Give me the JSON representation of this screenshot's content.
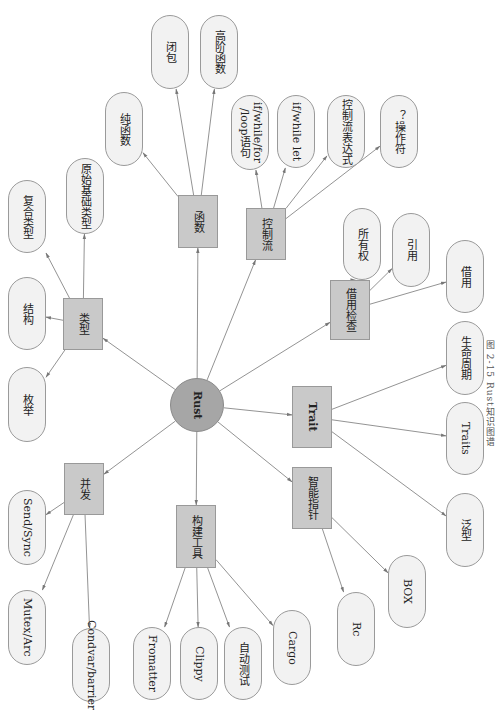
{
  "caption": "图 2-15  Rust知识图谱",
  "colors": {
    "root_fill": "#a6a6a6",
    "branch_fill": "#c9c9c9",
    "leaf_fill": "#f2f2f2",
    "edge": "#777777"
  },
  "root": {
    "id": "rust",
    "label": "Rust",
    "cx": 197,
    "cy": 405,
    "r": 27
  },
  "branches": [
    {
      "id": "types",
      "label": "类型",
      "x": 63,
      "y": 298,
      "w": 40,
      "h": 52
    },
    {
      "id": "functions",
      "label": "函数",
      "x": 178,
      "y": 195,
      "w": 40,
      "h": 53
    },
    {
      "id": "control-flow",
      "label": "控制流",
      "x": 246,
      "y": 208,
      "w": 40,
      "h": 52
    },
    {
      "id": "borrow-check",
      "label": "借用检查",
      "x": 330,
      "y": 280,
      "w": 40,
      "h": 60
    },
    {
      "id": "trait",
      "label": "Trait",
      "x": 292,
      "y": 386,
      "w": 40,
      "h": 62,
      "bold": true
    },
    {
      "id": "smart-pointers",
      "label": "智能指针",
      "x": 292,
      "y": 467,
      "w": 40,
      "h": 62
    },
    {
      "id": "build-tools",
      "label": "构建工具",
      "x": 176,
      "y": 505,
      "w": 40,
      "h": 63
    },
    {
      "id": "concurrency",
      "label": "并发",
      "x": 64,
      "y": 463,
      "w": 40,
      "h": 52
    }
  ],
  "leaves": [
    {
      "id": "compound-types",
      "parent": "types",
      "label": "复合类型",
      "x": 8,
      "y": 180,
      "w": 38,
      "h": 73
    },
    {
      "id": "primitive-types",
      "parent": "types",
      "label": "原始基础类型",
      "x": 66,
      "y": 158,
      "w": 38,
      "h": 76
    },
    {
      "id": "struct",
      "parent": "types",
      "label": "结构",
      "x": 8,
      "y": 277,
      "w": 38,
      "h": 73
    },
    {
      "id": "enum",
      "parent": "types",
      "label": "枚举",
      "x": 8,
      "y": 367,
      "w": 38,
      "h": 75
    },
    {
      "id": "pure-functions",
      "parent": "functions",
      "label": "纯函数",
      "x": 105,
      "y": 92,
      "w": 38,
      "h": 74
    },
    {
      "id": "closures",
      "parent": "functions",
      "label": "闭包",
      "x": 151,
      "y": 15,
      "w": 38,
      "h": 74
    },
    {
      "id": "higher-order-functions",
      "parent": "functions",
      "label": "高阶函数",
      "x": 200,
      "y": 15,
      "w": 38,
      "h": 74
    },
    {
      "id": "loop-statements",
      "parent": "control-flow",
      "label": "if/while/for\n/loop语句",
      "x": 231,
      "y": 95,
      "w": 38,
      "h": 75
    },
    {
      "id": "if-while-let",
      "parent": "control-flow",
      "label": "if/while let",
      "x": 277,
      "y": 95,
      "w": 38,
      "h": 73
    },
    {
      "id": "control-flow-expr",
      "parent": "control-flow",
      "label": "控制流表达式",
      "x": 327,
      "y": 95,
      "w": 38,
      "h": 73
    },
    {
      "id": "question-operator",
      "parent": "control-flow",
      "label": "？操作符",
      "x": 380,
      "y": 95,
      "w": 38,
      "h": 73
    },
    {
      "id": "ownership",
      "parent": "borrow-check",
      "label": "所有权",
      "x": 343,
      "y": 208,
      "w": 38,
      "h": 72
    },
    {
      "id": "references",
      "parent": "borrow-check",
      "label": "引用",
      "x": 392,
      "y": 213,
      "w": 38,
      "h": 74
    },
    {
      "id": "borrowing",
      "parent": "borrow-check",
      "label": "借用",
      "x": 446,
      "y": 240,
      "w": 38,
      "h": 73
    },
    {
      "id": "lifetimes",
      "parent": "trait",
      "label": "生命周期",
      "x": 446,
      "y": 321,
      "w": 38,
      "h": 74
    },
    {
      "id": "traits",
      "parent": "trait",
      "label": "Traits",
      "x": 446,
      "y": 402,
      "w": 38,
      "h": 73
    },
    {
      "id": "generics",
      "parent": "trait",
      "label": "泛型",
      "x": 446,
      "y": 493,
      "w": 38,
      "h": 74
    },
    {
      "id": "box",
      "parent": "smart-pointers",
      "label": "BOX",
      "x": 388,
      "y": 555,
      "w": 38,
      "h": 73
    },
    {
      "id": "rc",
      "parent": "smart-pointers",
      "label": "Rc",
      "x": 337,
      "y": 592,
      "w": 38,
      "h": 74
    },
    {
      "id": "cargo",
      "parent": "build-tools",
      "label": "Cargo",
      "x": 273,
      "y": 610,
      "w": 38,
      "h": 75
    },
    {
      "id": "auto-test",
      "parent": "build-tools",
      "label": "自动测试",
      "x": 224,
      "y": 627,
      "w": 38,
      "h": 73
    },
    {
      "id": "clippy",
      "parent": "build-tools",
      "label": "Clippy",
      "x": 180,
      "y": 627,
      "w": 38,
      "h": 73
    },
    {
      "id": "formatter",
      "parent": "build-tools",
      "label": "Fromatter",
      "x": 133,
      "y": 627,
      "w": 38,
      "h": 73
    },
    {
      "id": "condvar-barrier",
      "parent": "concurrency",
      "label": "Condvar/barrier",
      "x": 72,
      "y": 628,
      "w": 38,
      "h": 74
    },
    {
      "id": "mutex-arc",
      "parent": "concurrency",
      "label": "Mutex/Arc",
      "x": 8,
      "y": 590,
      "w": 38,
      "h": 75
    },
    {
      "id": "send-sync",
      "parent": "concurrency",
      "label": "Send/Sync",
      "x": 8,
      "y": 490,
      "w": 38,
      "h": 75
    }
  ]
}
